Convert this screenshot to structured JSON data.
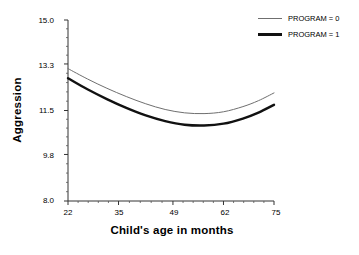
{
  "chart_data": {
    "type": "line",
    "title": "",
    "xlabel": "Child's age in months",
    "ylabel": "Aggression",
    "xlim": [
      22,
      75
    ],
    "ylim": [
      8.0,
      15.0
    ],
    "xticks": [
      22,
      35,
      49,
      62,
      75
    ],
    "xtick_labels": [
      "22",
      "35",
      "49",
      "62",
      "75"
    ],
    "yticks": [
      8.0,
      9.8,
      11.5,
      13.3,
      15.0
    ],
    "ytick_labels": [
      "8.0",
      "9.8",
      "11.5",
      "13.3",
      "15.0"
    ],
    "grid": false,
    "legend_position": "top-right",
    "minor_ticks": true,
    "series": [
      {
        "name": "PROGRAM = 0",
        "style": "thin",
        "color": "#6f6f6f",
        "x": [
          22,
          27,
          32,
          37,
          42,
          47,
          52,
          57,
          62,
          67,
          71,
          75
        ],
        "values": [
          13.12,
          12.72,
          12.36,
          12.04,
          11.76,
          11.54,
          11.41,
          11.38,
          11.45,
          11.65,
          11.88,
          12.18
        ]
      },
      {
        "name": "PROGRAM = 1",
        "style": "thick",
        "color": "#111111",
        "x": [
          22,
          27,
          32,
          37,
          42,
          47,
          52,
          57,
          62,
          67,
          71,
          75
        ],
        "values": [
          12.75,
          12.32,
          11.94,
          11.6,
          11.31,
          11.09,
          10.95,
          10.92,
          10.99,
          11.19,
          11.42,
          11.72
        ]
      }
    ]
  },
  "legend": {
    "items": [
      {
        "label": "PROGRAM = 0"
      },
      {
        "label": "PROGRAM = 1"
      }
    ]
  },
  "axes": {
    "x_title": "Child's age in months",
    "y_title": "Aggression"
  }
}
